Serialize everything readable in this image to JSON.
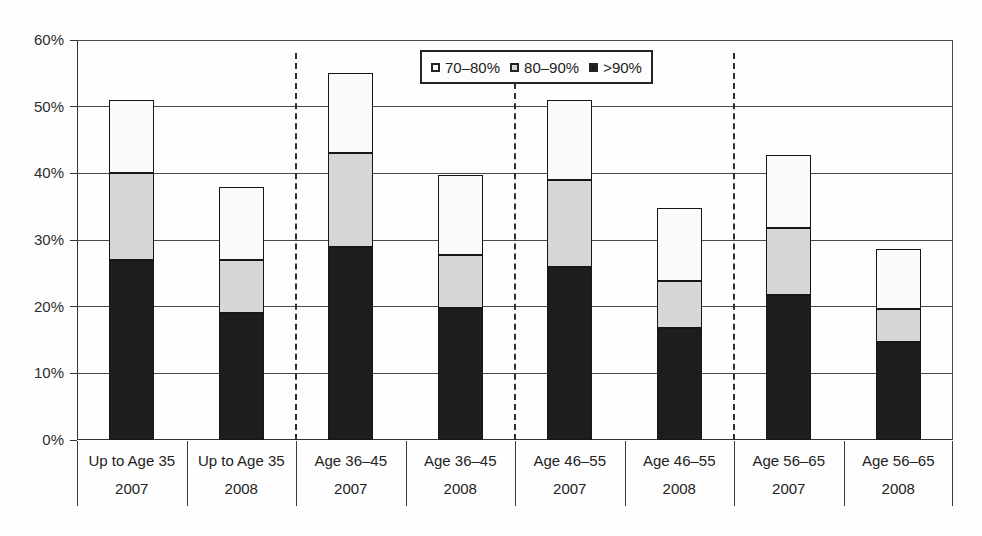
{
  "figure": {
    "background": "#fefefe",
    "axis_color": "#3a3a3a",
    "gridline_color": "#4a4a4a",
    "text_color": "#2a2a2a",
    "bar_outline_color": "#161616",
    "group_separator_style": "dashed"
  },
  "legend": {
    "items": [
      {
        "label": "70–80%",
        "swatch_color": "#fafafa"
      },
      {
        "label": "80–90%",
        "swatch_color": "#d6d6d6"
      },
      {
        "label": ">90%",
        "swatch_color": "#1d1d1d"
      }
    ]
  },
  "chart_data": {
    "type": "bar",
    "stacked": true,
    "title": "",
    "xlabel": "",
    "ylabel": "",
    "ylim": [
      0,
      60
    ],
    "y_tick_step": 10,
    "y_ticks": [
      "0%",
      "10%",
      "20%",
      "30%",
      "40%",
      "50%",
      "60%"
    ],
    "grid": true,
    "legend_position": "top-center-inside",
    "categories": [
      {
        "group": "Up to Age 35",
        "year": "2007"
      },
      {
        "group": "Up to Age 35",
        "year": "2008"
      },
      {
        "group": "Age 36–45",
        "year": "2007"
      },
      {
        "group": "Age 36–45",
        "year": "2008"
      },
      {
        "group": "Age 46–55",
        "year": "2007"
      },
      {
        "group": "Age 46–55",
        "year": "2008"
      },
      {
        "group": "Age 56–65",
        "year": "2007"
      },
      {
        "group": "Age 56–65",
        "year": "2008"
      }
    ],
    "stack_order_bottom_to_top": [
      ">90%",
      "80–90%",
      "70–80%"
    ],
    "series": [
      {
        "name": ">90%",
        "color": "#1d1d1d",
        "values": [
          27,
          19,
          29,
          19.8,
          26,
          16.8,
          21.8,
          14.7
        ]
      },
      {
        "name": "80–90%",
        "color": "#d6d6d6",
        "values": [
          13,
          8,
          14,
          8,
          13,
          7,
          10,
          5
        ]
      },
      {
        "name": "70–80%",
        "color": "#fafafa",
        "values": [
          11,
          11,
          12,
          11.9,
          12,
          11,
          11,
          9
        ]
      }
    ],
    "totals": [
      51,
      38,
      55,
      39.7,
      51,
      34.8,
      42.8,
      28.7
    ],
    "group_separator_after_indices": [
      1,
      3,
      5
    ]
  }
}
